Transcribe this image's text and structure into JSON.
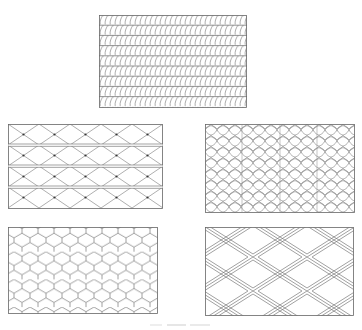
{
  "figure": {
    "caption": "",
    "line_color": "#666666",
    "background": "#ffffff",
    "panels": [
      {
        "id": "top",
        "pattern": "slanted-curl-rows",
        "description": "Rows of slanted S-shaped strokes separated by horizontal lines",
        "rows": 9
      },
      {
        "id": "middle-left",
        "pattern": "diamond-lattice-bands",
        "description": "Diamond lattice with dots at intersections, divided into 4 horizontal bands by double lines",
        "bands": 4
      },
      {
        "id": "middle-right",
        "pattern": "curved-scale-net",
        "description": "Interlocking curved scale / wavy net pattern"
      },
      {
        "id": "bottom-left",
        "pattern": "hexagon-honeycomb",
        "description": "Regular hexagonal honeycomb grid"
      },
      {
        "id": "bottom-right",
        "pattern": "double-line-diamond-mesh",
        "description": "Expanded metal mesh of diamonds outlined with double lines"
      }
    ]
  }
}
